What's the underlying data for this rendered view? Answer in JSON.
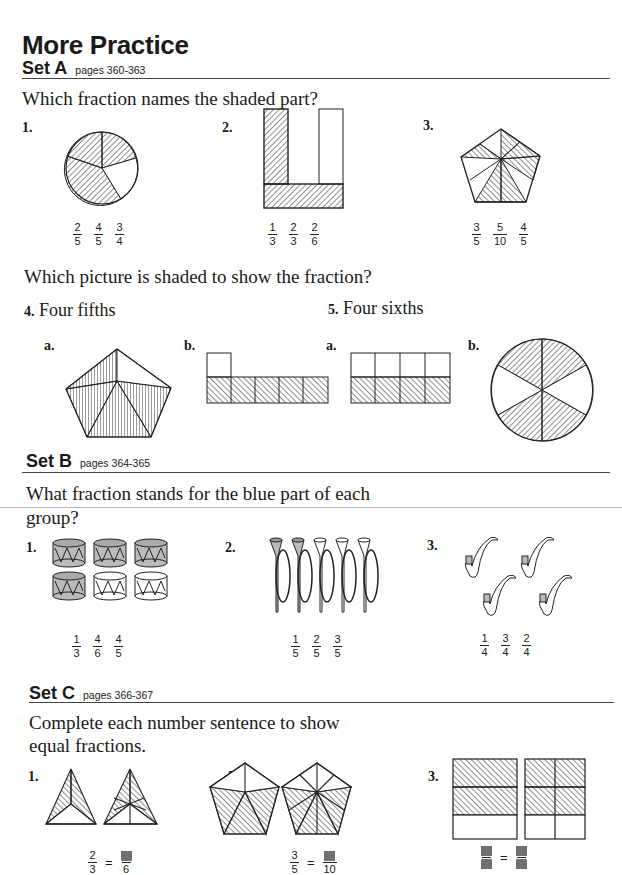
{
  "title": "More Practice",
  "sets": [
    {
      "name": "Set A",
      "pages": "pages 360-363",
      "question1": "Which fraction names the shaded part?",
      "items": [
        {
          "num": "1.",
          "choices": [
            [
              "2",
              "5"
            ],
            [
              "4",
              "5"
            ],
            [
              "3",
              "4"
            ]
          ]
        },
        {
          "num": "2.",
          "choices": [
            [
              "1",
              "3"
            ],
            [
              "2",
              "3"
            ],
            [
              "2",
              "6"
            ]
          ]
        },
        {
          "num": "3.",
          "choices": [
            [
              "3",
              "5"
            ],
            [
              "5",
              "10"
            ],
            [
              "4",
              "5"
            ]
          ]
        }
      ],
      "question2": "Which picture is shaded to show the fraction?",
      "item4": {
        "num": "4.",
        "label": "Four fifths",
        "a": "a.",
        "b": "b."
      },
      "item5": {
        "num": "5.",
        "label": "Four sixths",
        "a": "a.",
        "b": "b."
      }
    },
    {
      "name": "Set B",
      "pages": "pages 364-365",
      "question": "What fraction stands for the blue part of each group?",
      "question_line1": "What fraction stands for the blue part of each",
      "question_line2": "group?",
      "items": [
        {
          "num": "1.",
          "choices": [
            [
              "1",
              "3"
            ],
            [
              "4",
              "6"
            ],
            [
              "4",
              "5"
            ]
          ]
        },
        {
          "num": "2.",
          "choices": [
            [
              "1",
              "5"
            ],
            [
              "2",
              "5"
            ],
            [
              "3",
              "5"
            ]
          ]
        },
        {
          "num": "3.",
          "choices": [
            [
              "1",
              "4"
            ],
            [
              "3",
              "4"
            ],
            [
              "2",
              "4"
            ]
          ]
        }
      ]
    },
    {
      "name": "Set C",
      "pages": "pages 366-367",
      "question_line1": "Complete each number sentence to show",
      "question_line2": "equal fractions.",
      "items": [
        {
          "num": "1.",
          "left": [
            "2",
            "3"
          ],
          "equals": "=",
          "right_den": "6"
        },
        {
          "num": "2.",
          "left": [
            "3",
            "5"
          ],
          "equals": "=",
          "right_den": "10"
        },
        {
          "num": "3.",
          "equals": "="
        }
      ]
    }
  ]
}
